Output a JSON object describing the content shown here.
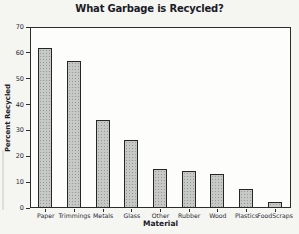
{
  "chart_data": {
    "type": "bar",
    "title": "What Garbage is Recycled?",
    "xlabel": "Material",
    "ylabel": "Percent Recycled",
    "categories": [
      "Paper",
      "Trimmings",
      "Metals",
      "Glass",
      "Other",
      "Rubber",
      "Wood",
      "Plastics",
      "FoodScraps"
    ],
    "values": [
      62,
      57,
      34,
      26,
      15,
      14,
      13,
      7,
      2
    ],
    "ylim": [
      0,
      70
    ],
    "yticks": [
      0,
      10,
      20,
      30,
      40,
      50,
      60,
      70
    ],
    "grid": false,
    "legend": "none",
    "bar_color": "#c7c9c6",
    "bar_border": "#262626",
    "axis_color": "#2c2c2c",
    "background_color": "#f5f5f2",
    "plot_background_color": "#fdfdfb"
  }
}
